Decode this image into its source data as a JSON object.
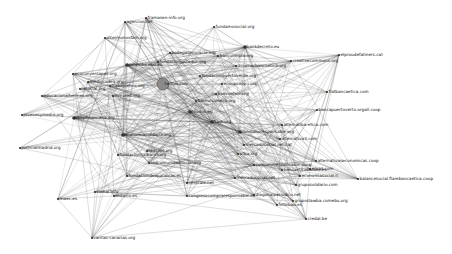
{
  "graph": {
    "type": "network",
    "nodes": [
      {
        "id": "n1",
        "label": "framasen-info.org"
      },
      {
        "id": "n2",
        "label": "agenzon.net"
      },
      {
        "id": "n3",
        "label": "fundamosocial.org"
      },
      {
        "id": "n4",
        "label": "intermonoxfam.org"
      },
      {
        "id": "n5",
        "label": "bankdecreto.eu"
      },
      {
        "id": "n6",
        "label": "elproudefatiners.cat"
      },
      {
        "id": "n7",
        "label": "creativecommons.org"
      },
      {
        "id": "n8",
        "label": "dinamarbancoetica.org"
      },
      {
        "id": "n9",
        "label": "bodegasenoracle.org"
      },
      {
        "id": "n10",
        "label": "bancolimpia.org"
      },
      {
        "id": "n11",
        "label": "fundacionjustaduc.org"
      },
      {
        "id": "n12",
        "label": "ecoopcoop.coop"
      },
      {
        "id": "n13",
        "label": "fiatbancaetica.com"
      },
      {
        "id": "n14",
        "label": "bancoetico.org"
      },
      {
        "id": "n15",
        "label": "setembe.ehu.es"
      },
      {
        "id": "n16",
        "label": "ecoconversapez.org"
      },
      {
        "id": "n17",
        "label": "mediocodea.org"
      },
      {
        "id": "n18",
        "label": "trabajoetico.org"
      },
      {
        "id": "n19",
        "label": "lasocial.org"
      },
      {
        "id": "n20",
        "label": "twitter.com"
      },
      {
        "id": "n21",
        "label": "educacionalhermes.org"
      },
      {
        "id": "n22",
        "label": "inmonet.org"
      },
      {
        "id": "n23",
        "label": "fundacionpuertoverde.org"
      },
      {
        "id": "n24",
        "label": "bancapuertoverto.orgall.coop"
      },
      {
        "id": "n25",
        "label": "fiaresocioseco.org"
      },
      {
        "id": "n26",
        "label": "jovenesymedio.org"
      },
      {
        "id": "n27",
        "label": "coopfinanciera.org"
      },
      {
        "id": "n28",
        "label": "alternatiba-etica.com"
      },
      {
        "id": "n29",
        "label": "consumoresponsable.org"
      },
      {
        "id": "n30",
        "label": "alternativa3.com"
      },
      {
        "id": "n31",
        "label": "justicialmadrid.org"
      },
      {
        "id": "n32",
        "label": "mercadosocial.net.cat"
      },
      {
        "id": "n33",
        "label": "economiasolidaria.org"
      },
      {
        "id": "n34",
        "label": "fiare.org"
      },
      {
        "id": "n35",
        "label": "alternativaseconomicas.coop"
      },
      {
        "id": "n36",
        "label": "ptbu.org"
      },
      {
        "id": "n37",
        "label": "email.com"
      },
      {
        "id": "n38",
        "label": "fundacionitalbanci.org"
      },
      {
        "id": "n39",
        "label": "economiasocial.it"
      },
      {
        "id": "n40",
        "label": "triodos.es"
      },
      {
        "id": "n41",
        "label": "balancesocial.fiarebancaetica.coop"
      },
      {
        "id": "n42",
        "label": "consumoresponsable.coop"
      },
      {
        "id": "n43",
        "label": "reasnet.org"
      },
      {
        "id": "n44",
        "label": "mercadosocial.net"
      },
      {
        "id": "n45",
        "label": "gruposolidario.com"
      },
      {
        "id": "n46",
        "label": "bancaeticabalaeo.es"
      },
      {
        "id": "n47",
        "label": "redcomunidadsocial.org"
      },
      {
        "id": "n48",
        "label": "gruposlawba.comebu.org"
      },
      {
        "id": "n49",
        "label": "fundaciondeepalabras.es"
      },
      {
        "id": "n50",
        "label": "maec.es"
      },
      {
        "id": "n51",
        "label": "comal.info"
      },
      {
        "id": "n52",
        "label": "eldiario.es"
      },
      {
        "id": "n53",
        "label": "centrale.net"
      },
      {
        "id": "n54",
        "label": "diagonalperiodico.net"
      },
      {
        "id": "n55",
        "label": "fetbibao.es"
      },
      {
        "id": "n56",
        "label": "congresocompraresponsable.es"
      },
      {
        "id": "n57",
        "label": "credal.be"
      },
      {
        "id": "n58",
        "label": "caritas-canarias.org"
      }
    ]
  }
}
